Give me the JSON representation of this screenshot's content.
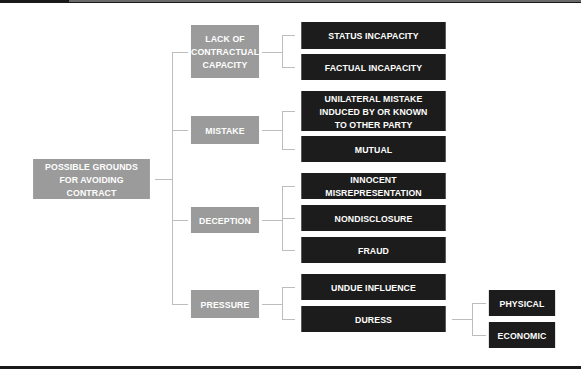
{
  "diagram": {
    "type": "tree",
    "colors": {
      "category": "#9b9b9b",
      "leaf": "#1c1c1c",
      "connector": "#bdbdbd",
      "text": "#ffffff"
    },
    "root": {
      "label": "POSSIBLE GROUNDS FOR AVOIDING CONTRACT"
    },
    "categories": [
      {
        "label": "LACK OF CONTRACTUAL CAPACITY",
        "children": [
          {
            "label": "STATUS INCAPACITY"
          },
          {
            "label": "FACTUAL INCAPACITY"
          }
        ]
      },
      {
        "label": "MISTAKE",
        "children": [
          {
            "label": "UNILATERAL MISTAKE INDUCED BY OR KNOWN TO OTHER PARTY"
          },
          {
            "label": "MUTUAL"
          }
        ]
      },
      {
        "label": "DECEPTION",
        "children": [
          {
            "label": "INNOCENT MISREPRESENTATION"
          },
          {
            "label": "NONDISCLOSURE"
          },
          {
            "label": "FRAUD"
          }
        ]
      },
      {
        "label": "PRESSURE",
        "children": [
          {
            "label": "UNDUE INFLUENCE"
          },
          {
            "label": "DURESS",
            "children": [
              {
                "label": "PHYSICAL"
              },
              {
                "label": "ECONOMIC"
              }
            ]
          }
        ]
      }
    ]
  }
}
